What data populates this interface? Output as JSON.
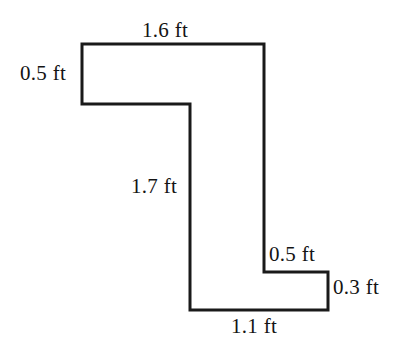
{
  "figure": {
    "units": "ft",
    "stroke_color": "#1a1a1a",
    "fill_color": "#ffffff",
    "stroke_width": 3,
    "labels": {
      "top": "1.6 ft",
      "left": "0.5 ft",
      "middle_vertical": "1.7 ft",
      "step_horizontal": "0.5 ft",
      "right_vertical": "0.3 ft",
      "bottom": "1.1 ft"
    }
  },
  "chart_data": {
    "type": "diagram",
    "subtype": "rectilinear-polygon-with-dimension-labels",
    "units": "ft",
    "vertices_px": [
      [
        82,
        44
      ],
      [
        264,
        44
      ],
      [
        264,
        272
      ],
      [
        328,
        272
      ],
      [
        328,
        310
      ],
      [
        190,
        310
      ],
      [
        190,
        104
      ],
      [
        82,
        104
      ]
    ],
    "edges": [
      {
        "name": "top",
        "from": [
          82,
          44
        ],
        "to": [
          264,
          44
        ],
        "orientation": "horizontal",
        "label": "1.6 ft",
        "value": 1.6
      },
      {
        "name": "right-upper",
        "from": [
          264,
          44
        ],
        "to": [
          264,
          272
        ],
        "orientation": "vertical",
        "label": null,
        "value": null
      },
      {
        "name": "step",
        "from": [
          264,
          272
        ],
        "to": [
          328,
          272
        ],
        "orientation": "horizontal",
        "label": "0.5 ft",
        "value": 0.5
      },
      {
        "name": "right-lower",
        "from": [
          328,
          272
        ],
        "to": [
          328,
          310
        ],
        "orientation": "vertical",
        "label": "0.3 ft",
        "value": 0.3
      },
      {
        "name": "bottom",
        "from": [
          328,
          310
        ],
        "to": [
          190,
          310
        ],
        "orientation": "horizontal",
        "label": "1.1 ft",
        "value": 1.1
      },
      {
        "name": "middle-vertical",
        "from": [
          190,
          310
        ],
        "to": [
          190,
          104
        ],
        "orientation": "vertical",
        "label": "1.7 ft",
        "value": 1.7
      },
      {
        "name": "notch",
        "from": [
          190,
          104
        ],
        "to": [
          82,
          104
        ],
        "orientation": "horizontal",
        "label": null,
        "value": null
      },
      {
        "name": "left",
        "from": [
          82,
          104
        ],
        "to": [
          82,
          44
        ],
        "orientation": "vertical",
        "label": "0.5 ft",
        "value": 0.5
      }
    ],
    "labeled_values": [
      1.6,
      0.5,
      1.7,
      0.5,
      0.3,
      1.1
    ],
    "grid": false,
    "legend": false
  }
}
